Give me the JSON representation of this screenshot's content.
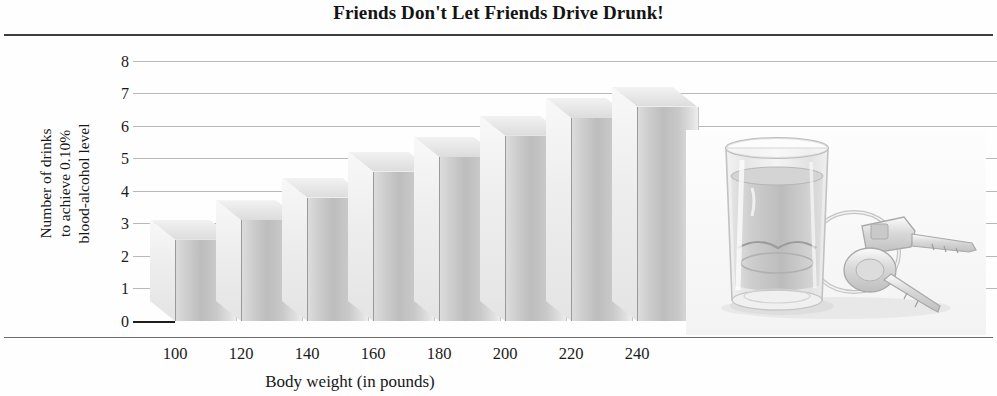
{
  "chart_data": {
    "type": "bar",
    "title": "Friends Don't Let Friends Drive Drunk!",
    "xlabel": "Body weight (in pounds)",
    "ylabel": "Number of drinks to achieve 0.10% blood-alcohol level",
    "ylabel_lines": [
      "Number of drinks",
      "to achieve 0.10%",
      "blood-alcohol level"
    ],
    "categories": [
      "100",
      "120",
      "140",
      "160",
      "180",
      "200",
      "220",
      "240"
    ],
    "values": [
      2.5,
      3.1,
      3.8,
      4.6,
      5.05,
      5.7,
      6.25,
      6.6
    ],
    "ylim": [
      0,
      8
    ],
    "yticks": [
      "0",
      "1",
      "2",
      "3",
      "4",
      "5",
      "6",
      "7",
      "8"
    ],
    "grid": true,
    "legend": null,
    "style": "3d-bars-grayscale"
  },
  "figure": {
    "background_color": "#fefefe",
    "bar_color": "#cfcfcf",
    "grid_color": "#b9b9b9",
    "axis_color": "#1d1d1d",
    "text_color": "#1a1a1a"
  },
  "photo": {
    "caption": "shot glass of liquor with car keys on a keyring",
    "elements": [
      "shot-glass",
      "car-keys",
      "keyring"
    ]
  }
}
